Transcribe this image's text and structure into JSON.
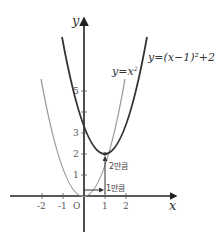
{
  "diagram": {
    "axes": {
      "x_label": "x",
      "y_label": "y",
      "origin_label": "O",
      "x_ticks": [
        "-2",
        "-1",
        "1",
        "2"
      ],
      "y_ticks": [
        "1",
        "2",
        "3",
        "5"
      ]
    },
    "curves": [
      {
        "name": "y=x^2",
        "label": "y=x",
        "exponent": "2",
        "color": "#9a9a9a"
      },
      {
        "name": "y=(x-1)^2+2",
        "label": "y=(x−1)²+2",
        "color": "#333333"
      }
    ],
    "annotations": {
      "shift_x": "1만큼",
      "shift_y": "2만큼"
    },
    "colors": {
      "axis": "#222222",
      "parabola_base": "#9a9a9a",
      "parabola_shifted": "#333333"
    }
  }
}
